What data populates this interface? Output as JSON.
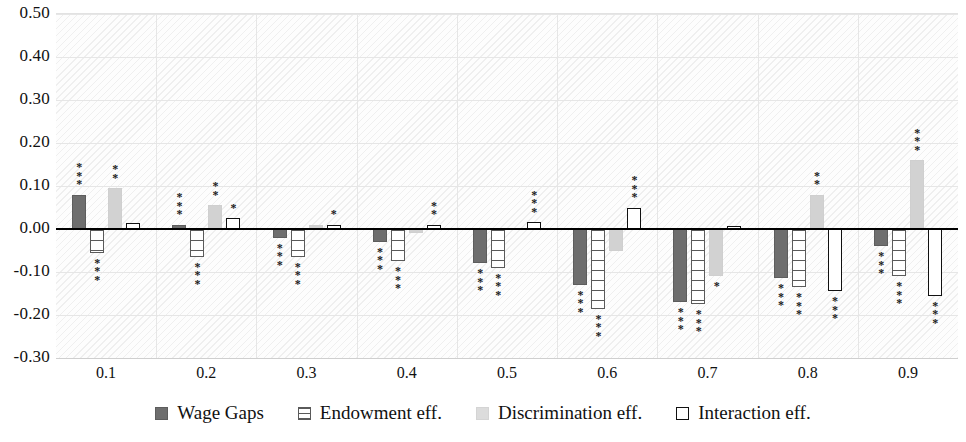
{
  "chart_data": {
    "type": "bar",
    "title": "",
    "xlabel": "",
    "ylabel": "",
    "categories": [
      "0.1",
      "0.2",
      "0.3",
      "0.4",
      "0.5",
      "0.6",
      "0.7",
      "0.8",
      "0.9"
    ],
    "ylim": [
      -0.3,
      0.5
    ],
    "yticks": [
      "0.50",
      "0.40",
      "0.30",
      "0.20",
      "0.10",
      "0.00",
      "-0.10",
      "-0.20",
      "-0.30"
    ],
    "ytick_values": [
      0.5,
      0.4,
      0.3,
      0.2,
      0.1,
      0.0,
      -0.1,
      -0.2,
      -0.3
    ],
    "grid": true,
    "legend_position": "bottom",
    "zero_line": 0.0,
    "series": [
      {
        "name": "Wage Gaps",
        "key": "wage",
        "color": "#6e6e6e",
        "values": [
          0.08,
          0.01,
          -0.02,
          -0.03,
          -0.08,
          -0.13,
          -0.17,
          -0.115,
          -0.04
        ],
        "significance": [
          "***",
          "***",
          "***",
          "***",
          "***",
          "***",
          "***",
          "***",
          "***"
        ]
      },
      {
        "name": "Endowment eff.",
        "key": "endow",
        "color": "#ffffff",
        "values": [
          -0.055,
          -0.065,
          -0.065,
          -0.075,
          -0.09,
          -0.185,
          -0.175,
          -0.135,
          -0.11
        ],
        "significance": [
          "***",
          "***",
          "***",
          "***",
          "***",
          "***",
          "***",
          "***",
          "***"
        ]
      },
      {
        "name": "Discrimination eff.",
        "key": "discrim",
        "color": "#d2d2d2",
        "values": [
          0.095,
          0.055,
          0.01,
          -0.01,
          0.002,
          -0.05,
          -0.11,
          0.08,
          0.16
        ],
        "significance": [
          "**",
          "**",
          "",
          "",
          "",
          "",
          "*",
          "**",
          "***"
        ]
      },
      {
        "name": "Interaction eff.",
        "key": "interact",
        "color": "#ffffff",
        "values": [
          0.015,
          0.025,
          0.01,
          0.01,
          0.016,
          0.05,
          0.006,
          -0.145,
          -0.155
        ],
        "significance": [
          "",
          "*",
          "*",
          "**",
          "***",
          "***",
          "",
          "***",
          "***"
        ]
      }
    ]
  },
  "legend": {
    "items": [
      {
        "label": "Wage Gaps",
        "key": "wage"
      },
      {
        "label": "Endowment eff.",
        "key": "endow"
      },
      {
        "label": "Discrimination eff.",
        "key": "discrim"
      },
      {
        "label": "Interaction eff.",
        "key": "interact"
      }
    ]
  }
}
